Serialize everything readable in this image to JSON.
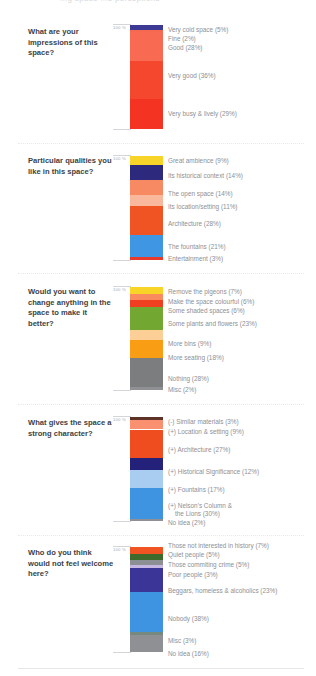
{
  "header": {
    "clipped_text": "...g   space    ...e perceptions"
  },
  "axis": {
    "top_label": "100 %"
  },
  "sections": [
    {
      "id": "impressions",
      "question": "What are your impressions of this space?",
      "chart": {
        "type": "bar",
        "stacked": true,
        "title": "What are your impressions of this space?",
        "ylabel": "100 %",
        "ylim": [
          0,
          100
        ],
        "categories": [
          "Very cold space",
          "Fine",
          "Good",
          "Very good",
          "Very busy & lively"
        ],
        "values": [
          5,
          2,
          28,
          36,
          29
        ],
        "labels": [
          "Very cold space (5%)",
          "Fine (2%)",
          "Good (28%)",
          "Very good (36%)",
          "Very busy & lively (29%)"
        ],
        "colors": [
          "#3c3a94",
          "#f4694f",
          "#f96a52",
          "#f4472e",
          "#f43322"
        ]
      }
    },
    {
      "id": "qualities",
      "question": "Particular qualities you like in this space?",
      "chart": {
        "type": "bar",
        "stacked": true,
        "title": "Particular qualities you like in this space?",
        "ylabel": "100 %",
        "ylim": [
          0,
          100
        ],
        "categories": [
          "Great ambience",
          "Its historical context",
          "The open space",
          "Its location/setting",
          "Architecture",
          "The fountains",
          "Entertainment"
        ],
        "values": [
          9,
          14,
          14,
          11,
          28,
          21,
          3
        ],
        "labels": [
          "Great ambience (9%)",
          "Its historical context (14%)",
          "The open space (14%)",
          "Its location/setting (11%)",
          "Architecture (28%)",
          "The fountains (21%)",
          "Entertainment (3%)"
        ],
        "colors": [
          "#f8d328",
          "#2d2a7e",
          "#f88a63",
          "#f9b89c",
          "#f05423",
          "#3f96e2",
          "#e8392a"
        ]
      }
    },
    {
      "id": "change",
      "question": "Would you want to change anything in the space to make it better?",
      "chart": {
        "type": "bar",
        "stacked": true,
        "title": "Would you want to change anything in the space to make it better?",
        "ylabel": "100 %",
        "ylim": [
          0,
          100
        ],
        "categories": [
          "Remove the pigeons",
          "Make the space colourful",
          "Some shaded spaces",
          "Some plants and flowers",
          "More bins",
          "More seating",
          "Nothing",
          "Misc"
        ],
        "values": [
          7,
          6,
          6,
          23,
          9,
          18,
          28,
          2
        ],
        "labels": [
          "Remove the pigeons (7%)",
          "Make the space colourful (6%)",
          "Some shaded spaces (6%)",
          "Some plants and flowers (23%)",
          "More bins (9%)",
          "More seating (18%)",
          "Nothing (28%)",
          "Misc (2%)"
        ],
        "colors": [
          "#f8d328",
          "#f98b5e",
          "#ef3f20",
          "#72a832",
          "#fbcf96",
          "#f99d14",
          "#7c7d7f",
          "#8f9093"
        ]
      }
    },
    {
      "id": "character",
      "question": "What gives the space a strong character?",
      "chart": {
        "type": "bar",
        "stacked": true,
        "title": "What gives the space a strong character?",
        "ylabel": "100 %",
        "ylim": [
          0,
          100
        ],
        "categories": [
          "(-) Similar materials",
          "(+) Location & setting",
          "(+) Architecture",
          "(+) Historical Significance",
          "(+) Fountains",
          "(+) Nelson's Column & the Lions",
          "No idea"
        ],
        "values": [
          3,
          9,
          27,
          12,
          17,
          30,
          2
        ],
        "labels": [
          "(-) Similar materials (3%)",
          "(+) Location & setting (9%)",
          "(+) Architecture  (27%)",
          "(+) Historical Significance (12%)",
          "(+) Fountains (17%)",
          "(+) Nelson's Column &",
          "the Lions (30%)",
          "No idea (2%)"
        ],
        "colors": [
          "#5d3327",
          "#f99070",
          "#ef4d1f",
          "#23217a",
          "#a9cdf0",
          "#3f94e2",
          "#8f9093"
        ]
      }
    },
    {
      "id": "welcome",
      "question": "Who do you think would not feel welcome here?",
      "chart": {
        "type": "bar",
        "stacked": true,
        "title": "Who do you think would not feel welcome here?",
        "ylabel": "100 %",
        "ylim": [
          0,
          100
        ],
        "categories": [
          "Those not interested in history",
          "Quiet people",
          "Those commiting crime",
          "Poor people",
          "Beggars, homeless & alcoholics",
          "Nobody",
          "Misc",
          "No idea"
        ],
        "values": [
          7,
          5,
          5,
          3,
          23,
          38,
          3,
          16
        ],
        "labels": [
          "Those not interested in history (7%)",
          "Quiet people (5%)",
          "Those commiting crime (5%)",
          "Poor people (3%)",
          "Beggars, homeless & alcoholics (23%)",
          "Nobody (38%)",
          "Misc (3%)",
          "No idea (16%)"
        ],
        "colors": [
          "#f05423",
          "#3e6b2c",
          "#8c8f93",
          "#c6b6e2",
          "#3c3598",
          "#3f94e2",
          "#76897e",
          "#8f9093"
        ]
      }
    }
  ]
}
